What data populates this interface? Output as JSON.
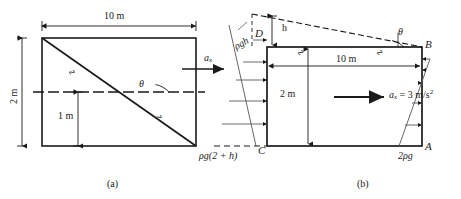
{
  "figure": {
    "panels": [
      {
        "id": "a",
        "caption": "(a)",
        "labels": {
          "length": "10 m",
          "height": "2 m",
          "mid_height": "1 m",
          "theta": "θ",
          "accel": "a",
          "accel_sub": "x",
          "pressure_bottom": "ρg(2 + h)",
          "break_marks": [
            "∿",
            "∿"
          ]
        }
      },
      {
        "id": "b",
        "caption": "(b)",
        "labels": {
          "length": "10 m",
          "height": "2 m",
          "surface_rise": "h",
          "theta": "θ",
          "accel_text": "a",
          "accel_sub": "x",
          "accel_value": " = 3 m/s",
          "accel_exp": "2",
          "corner_A": "A",
          "corner_B": "B",
          "corner_C": "C",
          "corner_D": "D",
          "pressure_top_left": "ρgh",
          "pressure_bottom_left": "ρg(2 + h)",
          "pressure_right": "2ρg",
          "break_marks": [
            "∿",
            "∿"
          ]
        }
      }
    ],
    "colors": {
      "stroke": "#1a1a1a",
      "dashed": "#2b2b2b",
      "thin": "#444444",
      "background": "#ffffff"
    }
  }
}
